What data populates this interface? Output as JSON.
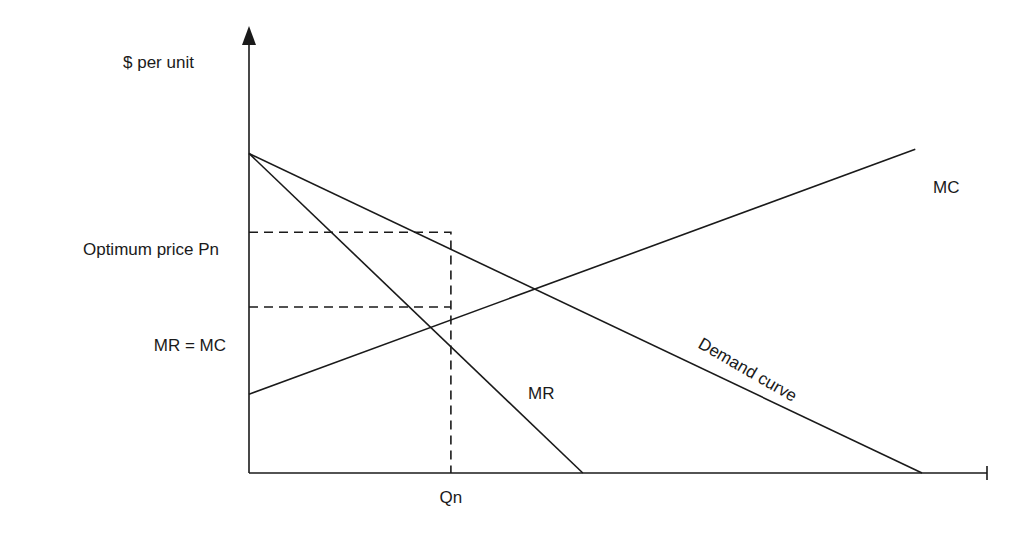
{
  "chart_data": {
    "type": "line",
    "title": "",
    "ylabel": "$ per unit",
    "xlabel": "",
    "y_axis_markers": [
      {
        "label": "Optimum price Pn",
        "value": 0.58
      },
      {
        "label": "MR = MC",
        "value": 0.4
      }
    ],
    "x_axis_markers": [
      {
        "label": "Qn",
        "value": 0.3
      }
    ],
    "xlim": [
      0,
      1.09
    ],
    "ylim": [
      0,
      1.0
    ],
    "series": [
      {
        "name": "Demand curve",
        "points": [
          [
            0,
            0.77
          ],
          [
            1.0,
            0
          ]
        ]
      },
      {
        "name": "MR",
        "points": [
          [
            0,
            0.77
          ],
          [
            0.496,
            0
          ]
        ]
      },
      {
        "name": "MC",
        "points": [
          [
            0,
            0.19
          ],
          [
            0.99,
            0.78
          ]
        ]
      }
    ],
    "guides": [
      {
        "name": "price-guide",
        "points": [
          [
            0,
            0.58
          ],
          [
            0.3,
            0.58
          ],
          [
            0.3,
            0
          ]
        ]
      },
      {
        "name": "mrmc-guide",
        "points": [
          [
            0,
            0.4
          ],
          [
            0.3,
            0.4
          ]
        ]
      }
    ],
    "annotations": {
      "mc": "MC",
      "mr": "MR",
      "demand": "Demand curve"
    }
  }
}
